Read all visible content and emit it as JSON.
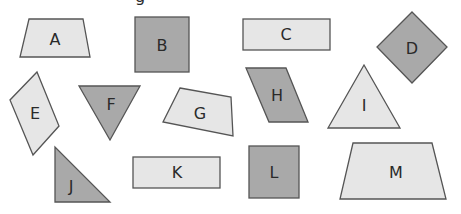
{
  "colors": {
    "light_fill": "#e6e6e6",
    "dark_fill": "#a9a9a9",
    "stroke": "#555555",
    "label": "#2a2a2a"
  },
  "top_fragment": "g",
  "shapes": [
    {
      "label": "A",
      "type": "trapezoid",
      "fill": "light"
    },
    {
      "label": "B",
      "type": "square",
      "fill": "dark"
    },
    {
      "label": "C",
      "type": "rectangle",
      "fill": "light"
    },
    {
      "label": "D",
      "type": "square-rotated",
      "fill": "dark"
    },
    {
      "label": "E",
      "type": "parallelogram",
      "fill": "light"
    },
    {
      "label": "F",
      "type": "triangle-inverted",
      "fill": "dark"
    },
    {
      "label": "G",
      "type": "quadrilateral",
      "fill": "light"
    },
    {
      "label": "H",
      "type": "parallelogram",
      "fill": "dark"
    },
    {
      "label": "I",
      "type": "triangle",
      "fill": "light"
    },
    {
      "label": "J",
      "type": "right-triangle",
      "fill": "dark"
    },
    {
      "label": "K",
      "type": "rectangle",
      "fill": "light"
    },
    {
      "label": "L",
      "type": "square",
      "fill": "dark"
    },
    {
      "label": "M",
      "type": "trapezoid",
      "fill": "light"
    }
  ]
}
